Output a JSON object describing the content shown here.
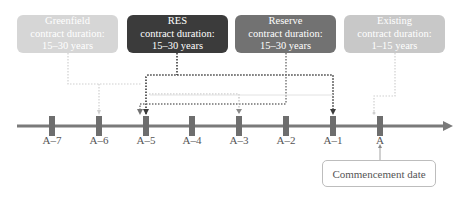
{
  "boxes": [
    {
      "id": "greenfield",
      "title": "Greenfield",
      "line2": "contract duration:",
      "line3": "15–30 years",
      "color": "#d6d6d6",
      "target_tick": "A–6"
    },
    {
      "id": "res",
      "title": "RES",
      "line2": "contract duration:",
      "line3": "15–30 years",
      "color": "#3b3b3b",
      "target_ticks": [
        "A–5",
        "A–1"
      ]
    },
    {
      "id": "reserve",
      "title": "Reserve",
      "line2": "contract duration:",
      "line3": "15–30 years",
      "color": "#727272",
      "target_ticks": [
        "A–5",
        "A–1"
      ]
    },
    {
      "id": "existing",
      "title": "Existing",
      "line2": "contract duration:",
      "line3": "1–15 years",
      "color": "#c8c8c8",
      "target_tick": "A"
    }
  ],
  "timeline": {
    "ticks": [
      "A–7",
      "A–6",
      "A–5",
      "A–4",
      "A–3",
      "A–2",
      "A–1",
      "A"
    ],
    "axis_color": "#7a7a7a"
  },
  "commencement": {
    "label": "Commencement date",
    "points_to": "A"
  }
}
